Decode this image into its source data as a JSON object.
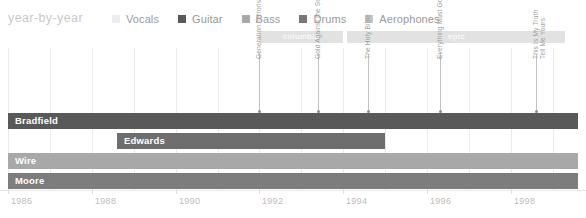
{
  "header": {
    "title": "year-by-year"
  },
  "legend": {
    "items": [
      {
        "label": "Vocals",
        "color": "#ededed"
      },
      {
        "label": "Guitar",
        "color": "#595959"
      },
      {
        "label": "Bass",
        "color": "#a8a8a8"
      },
      {
        "label": "Drums",
        "color": "#767676"
      },
      {
        "label": "Aerophones",
        "color": "#c4c4c4"
      }
    ]
  },
  "eras": [
    {
      "name": "columbia",
      "start": 1992.0,
      "end": 1994.0,
      "color": "#e2e2e2"
    },
    {
      "name": "epic",
      "start": 1994.1,
      "end": 1999.3,
      "color": "#e2e2e2"
    }
  ],
  "rows": [
    {
      "name": "Bradfield",
      "start": 1986.0,
      "end": 1999.6,
      "color": "#595959",
      "instrument": "Guitar"
    },
    {
      "name": "Edwards",
      "start": 1988.6,
      "end": 1995.0,
      "color": "#6e6e6e",
      "instrument": "Guitar"
    },
    {
      "name": "Wire",
      "start": 1986.0,
      "end": 1999.6,
      "color": "#a8a8a8",
      "instrument": "Bass"
    },
    {
      "name": "Moore",
      "start": 1986.0,
      "end": 1999.6,
      "color": "#7d7d7d",
      "instrument": "Drums"
    }
  ],
  "albums": [
    {
      "title": "Generation Terrorists",
      "year": 1992.0
    },
    {
      "title": "Gold Against the Soul",
      "year": 1993.4
    },
    {
      "title": "The Holy Bible",
      "year": 1994.6
    },
    {
      "title": "Everything Must Go",
      "year": 1996.3
    },
    {
      "title": "This Is My Truth\nTell Me Yours",
      "year": 1998.6
    }
  ],
  "axis": {
    "min": 1986,
    "max": 1999.6,
    "ticks": [
      1986,
      1988,
      1990,
      1992,
      1994,
      1996,
      1998
    ],
    "labels": [
      "1986",
      "1988",
      "1990",
      "1992",
      "1994",
      "1996",
      "1998"
    ]
  },
  "chart_data": {
    "type": "bar",
    "title": "year-by-year",
    "xlabel": "",
    "ylabel": "",
    "xlim": [
      1986,
      1999.6
    ],
    "grid": true,
    "legend_position": "top",
    "categories": [
      "Bradfield",
      "Edwards",
      "Wire",
      "Moore"
    ],
    "series": [
      {
        "name": "Bradfield",
        "instrument": "Guitar",
        "start": 1986.0,
        "end": 1999.6,
        "value": 13.6
      },
      {
        "name": "Edwards",
        "instrument": "Guitar",
        "start": 1988.6,
        "end": 1995.0,
        "value": 6.4
      },
      {
        "name": "Wire",
        "instrument": "Bass",
        "start": 1986.0,
        "end": 1999.6,
        "value": 13.6
      },
      {
        "name": "Moore",
        "instrument": "Drums",
        "start": 1986.0,
        "end": 1999.6,
        "value": 13.6
      }
    ],
    "annotations": [
      {
        "label": "Generation Terrorists",
        "x": 1992.0
      },
      {
        "label": "Gold Against the Soul",
        "x": 1993.4
      },
      {
        "label": "The Holy Bible",
        "x": 1994.6
      },
      {
        "label": "Everything Must Go",
        "x": 1996.3
      },
      {
        "label": "This Is My Truth Tell Me Yours",
        "x": 1998.6
      }
    ],
    "bands": [
      {
        "label": "columbia",
        "x0": 1992.0,
        "x1": 1994.0
      },
      {
        "label": "epic",
        "x0": 1994.1,
        "x1": 1999.3
      }
    ],
    "tick_labels": [
      "1986",
      "1988",
      "1990",
      "1992",
      "1994",
      "1996",
      "1998"
    ]
  }
}
